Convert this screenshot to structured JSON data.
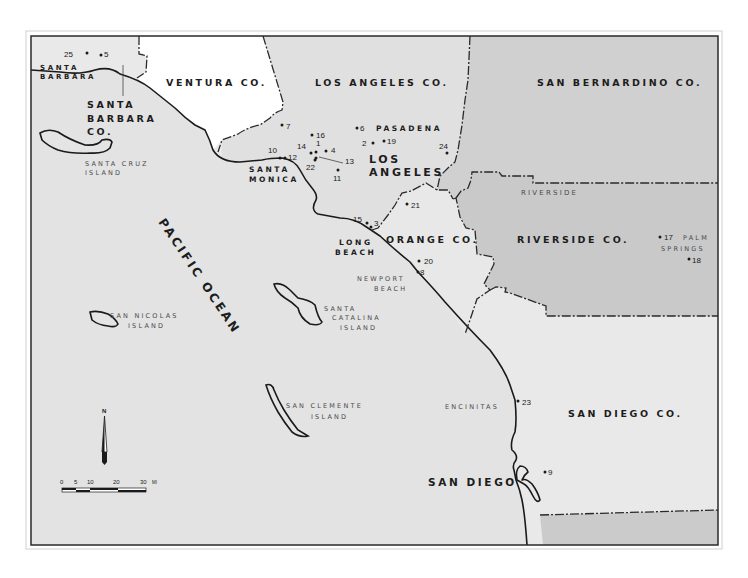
{
  "map": {
    "colors": {
      "ocean": "#e3e3e3",
      "land_light": "#e8e8e8",
      "ventura": "#ffffff",
      "los_angeles": "#dedede",
      "san_bernardino": "#cfcfcf",
      "riverside": "#c9c9c9",
      "mexico": "#cacaca",
      "frame": "#2a2a2a"
    },
    "counties": {
      "ventura": "VENTURA CO.",
      "los_angeles": "LOS ANGELES CO.",
      "san_bernardino": "SAN BERNARDINO CO.",
      "riverside": "RIVERSIDE CO.",
      "orange": "ORANGE CO.",
      "san_diego": "SAN DIEGO CO.",
      "santa_barbara": [
        "SANTA",
        "BARBARA",
        "CO."
      ]
    },
    "cities": {
      "santa_barbara": [
        "SANTA",
        "BARBARA"
      ],
      "pasadena": "PASADENA",
      "los_angeles": [
        "LOS",
        "ANGELES"
      ],
      "santa_monica": [
        "SANTA",
        "MONICA"
      ],
      "long_beach": [
        "LONG",
        "BEACH"
      ],
      "newport_beach": [
        "NEWPORT",
        "BEACH"
      ],
      "riverside": "RIVERSIDE",
      "palm_springs": [
        "PALM",
        "SPRINGS"
      ],
      "encinitas": "ENCINITAS",
      "san_diego": "SAN DIEGO"
    },
    "water": {
      "ocean": "PACIFIC OCEAN"
    },
    "islands": {
      "santa_cruz": [
        "SANTA CRUZ",
        "ISLAND"
      ],
      "san_nicolas": [
        "SAN NICOLAS",
        "ISLAND"
      ],
      "santa_catalina": [
        "SANTA",
        "CATALINA",
        "ISLAND"
      ],
      "san_clemente": [
        "SAN CLEMENTE",
        "ISLAND"
      ]
    },
    "sites": [
      {
        "id": "1",
        "x": 316,
        "y": 152,
        "lx": 316,
        "ly": 146
      },
      {
        "id": "2",
        "x": 373,
        "y": 143,
        "lx": 362,
        "ly": 146
      },
      {
        "id": "3",
        "x": 371,
        "y": 227,
        "lx": 374,
        "ly": 226
      },
      {
        "id": "4",
        "x": 326,
        "y": 151,
        "lx": 331,
        "ly": 153
      },
      {
        "id": "5",
        "x": 101,
        "y": 55,
        "lx": 104,
        "ly": 57
      },
      {
        "id": "6",
        "x": 357,
        "y": 128,
        "lx": 360,
        "ly": 131
      },
      {
        "id": "7",
        "x": 282,
        "y": 125,
        "lx": 286,
        "ly": 129
      },
      {
        "id": "8",
        "x": 418,
        "y": 272,
        "lx": 420,
        "ly": 275
      },
      {
        "id": "9",
        "x": 545,
        "y": 472,
        "lx": 548,
        "ly": 475
      },
      {
        "id": "10",
        "x": 280,
        "y": 158,
        "lx": 268,
        "ly": 153
      },
      {
        "id": "11",
        "x": 338,
        "y": 170,
        "lx": 333,
        "ly": 181
      },
      {
        "id": "12",
        "x": 285,
        "y": 158,
        "lx": 288,
        "ly": 160
      },
      {
        "id": "13",
        "x": 316,
        "y": 158,
        "lx": 345,
        "ly": 164
      },
      {
        "id": "14",
        "x": 311,
        "y": 153,
        "lx": 297,
        "ly": 149
      },
      {
        "id": "15",
        "x": 367,
        "y": 223,
        "lx": 353,
        "ly": 222
      },
      {
        "id": "16",
        "x": 312,
        "y": 135,
        "lx": 316,
        "ly": 138
      },
      {
        "id": "17",
        "x": 660,
        "y": 237,
        "lx": 664,
        "ly": 240
      },
      {
        "id": "18",
        "x": 689,
        "y": 259,
        "lx": 692,
        "ly": 263
      },
      {
        "id": "19",
        "x": 384,
        "y": 141,
        "lx": 387,
        "ly": 144
      },
      {
        "id": "20",
        "x": 419,
        "y": 261,
        "lx": 424,
        "ly": 264
      },
      {
        "id": "21",
        "x": 407,
        "y": 204,
        "lx": 411,
        "ly": 208
      },
      {
        "id": "22",
        "x": 315,
        "y": 160,
        "lx": 306,
        "ly": 170
      },
      {
        "id": "23",
        "x": 518,
        "y": 401,
        "lx": 522,
        "ly": 405
      },
      {
        "id": "24",
        "x": 447,
        "y": 153,
        "lx": 439,
        "ly": 149
      },
      {
        "id": "25",
        "x": 87,
        "y": 53,
        "lx": 64,
        "ly": 57
      }
    ],
    "scale_bar": {
      "ticks": [
        "0",
        "5",
        "10",
        "20",
        "30"
      ],
      "unit": "MI"
    },
    "north_arrow": {
      "label": "N"
    }
  }
}
